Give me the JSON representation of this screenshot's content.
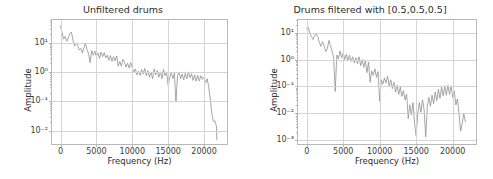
{
  "figure": {
    "background": "#ffffff",
    "line_color": "#8f8f8f",
    "grid_color": "#d4d4d4",
    "axis_color": "#b8b8b8"
  },
  "chart_data": [
    {
      "type": "line",
      "title": "Unfiltered drums",
      "xlabel": "Frequency (Hz)",
      "ylabel": "Amplitude",
      "yscale": "log",
      "xscale": "linear",
      "grid": true,
      "legend": "none",
      "xlim": [
        -1200,
        23200
      ],
      "ylim": [
        0.0035,
        60
      ],
      "xticks": [
        0,
        5000,
        10000,
        15000,
        20000
      ],
      "xticklabels": [
        "0",
        "5000",
        "10000",
        "15000",
        "20000"
      ],
      "yticks": [
        10,
        1,
        0.1,
        0.01
      ],
      "yticklabels": [
        "10¹",
        "10⁰",
        "10⁻¹",
        "10⁻²"
      ],
      "x": [
        0,
        220,
        440,
        660,
        880,
        1100,
        1320,
        1540,
        1760,
        1980,
        2200,
        2420,
        2640,
        2860,
        3080,
        3300,
        3520,
        3740,
        3960,
        4180,
        4400,
        4620,
        4840,
        5060,
        5280,
        5500,
        5720,
        5940,
        6160,
        6380,
        6600,
        6820,
        7040,
        7260,
        7480,
        7700,
        7920,
        8140,
        8360,
        8580,
        8800,
        9020,
        9240,
        9460,
        9680,
        9900,
        10120,
        10340,
        10560,
        10780,
        11000,
        11220,
        11440,
        11660,
        11880,
        12100,
        12320,
        12540,
        12760,
        12980,
        13200,
        13420,
        13640,
        13860,
        14080,
        14300,
        14520,
        14740,
        14960,
        15180,
        15400,
        15620,
        15840,
        16060,
        16280,
        16500,
        16720,
        16940,
        17160,
        17380,
        17600,
        17820,
        18040,
        18260,
        18480,
        18700,
        18920,
        19140,
        19360,
        19580,
        19800,
        20020,
        20240,
        20460,
        20680,
        20900,
        21120,
        21340,
        21560,
        21780,
        22000,
        22050
      ],
      "y": [
        38,
        22,
        13,
        16,
        11,
        14,
        20,
        23,
        12,
        7.5,
        9.5,
        8,
        5.5,
        6.2,
        4.3,
        6.5,
        9.5,
        5.5,
        4.0,
        2.0,
        5.2,
        3.6,
        5.0,
        3.2,
        4.3,
        2.8,
        4.6,
        3.2,
        4.4,
        2.9,
        3.6,
        2.4,
        3.5,
        2.2,
        3.2,
        2.3,
        3.4,
        1.5,
        2.2,
        1.5,
        2.6,
        2.0,
        1.4,
        1.9,
        1.3,
        2.0,
        1.3,
        0.95,
        1.2,
        0.75,
        1.0,
        0.72,
        1.15,
        0.8,
        1.25,
        0.7,
        1.05,
        0.62,
        0.95,
        0.55,
        1.2,
        0.75,
        1.05,
        0.62,
        0.95,
        0.55,
        1.15,
        0.7,
        0.95,
        0.32,
        0.62,
        0.9,
        0.55,
        0.85,
        0.085,
        0.7,
        0.95,
        0.55,
        0.8,
        0.5,
        0.85,
        0.55,
        0.95,
        0.6,
        0.82,
        0.48,
        0.75,
        0.45,
        0.72,
        0.46,
        0.7,
        0.52,
        0.62,
        0.4,
        0.55,
        0.28,
        0.11,
        0.035,
        0.018,
        0.019,
        0.012,
        0.0042
      ]
    },
    {
      "type": "line",
      "title": "Drums filtered with [0.5,0.5,0.5]",
      "xlabel": "Frequency (Hz)",
      "ylabel": "Amplitude",
      "yscale": "log",
      "xscale": "linear",
      "grid": true,
      "legend": "none",
      "xlim": [
        -1200,
        23200
      ],
      "ylim": [
        0.0007,
        30
      ],
      "xticks": [
        0,
        5000,
        10000,
        15000,
        20000
      ],
      "xticklabels": [
        "0",
        "5000",
        "10000",
        "15000",
        "20000"
      ],
      "yticks": [
        10,
        1,
        0.1,
        0.01,
        0.001
      ],
      "yticklabels": [
        "10¹",
        "10⁰",
        "10⁻¹",
        "10⁻²",
        "10⁻³"
      ],
      "x": [
        0,
        220,
        440,
        660,
        880,
        1100,
        1320,
        1540,
        1760,
        1980,
        2200,
        2420,
        2640,
        2860,
        3080,
        3300,
        3520,
        3740,
        3960,
        4180,
        4400,
        4620,
        4840,
        5060,
        5280,
        5500,
        5720,
        5940,
        6160,
        6380,
        6600,
        6820,
        7040,
        7260,
        7480,
        7700,
        7920,
        8140,
        8360,
        8580,
        8800,
        9020,
        9240,
        9460,
        9680,
        9900,
        10120,
        10340,
        10560,
        10780,
        11000,
        11220,
        11440,
        11660,
        11880,
        12100,
        12320,
        12540,
        12760,
        12980,
        13200,
        13420,
        13640,
        13860,
        14080,
        14300,
        14520,
        14740,
        14960,
        15180,
        15400,
        15620,
        15840,
        16060,
        16280,
        16500,
        16720,
        16940,
        17160,
        17380,
        17600,
        17820,
        18040,
        18260,
        18480,
        18700,
        18920,
        19140,
        19360,
        19580,
        19800,
        20020,
        20240,
        20460,
        20680,
        20900,
        21120,
        21340,
        21560,
        21780,
        22000,
        22050
      ],
      "y": [
        14,
        16,
        9.5,
        7.0,
        5.5,
        7.5,
        9.0,
        7.0,
        4.2,
        3.0,
        4.5,
        3.2,
        1.9,
        2.4,
        5.0,
        3.2,
        2.0,
        1.1,
        0.058,
        1.4,
        1.0,
        2.0,
        1.1,
        1.7,
        0.95,
        1.5,
        0.85,
        1.4,
        0.8,
        1.2,
        0.7,
        1.1,
        0.65,
        1.2,
        0.55,
        0.95,
        0.48,
        0.88,
        0.3,
        0.75,
        0.13,
        0.35,
        0.24,
        0.42,
        0.2,
        0.33,
        0.025,
        0.16,
        0.11,
        0.19,
        0.12,
        0.22,
        0.095,
        0.16,
        0.075,
        0.13,
        0.055,
        0.1,
        0.045,
        0.085,
        0.038,
        0.062,
        0.028,
        0.046,
        0.0055,
        0.018,
        0.0075,
        0.022,
        0.0035,
        0.0012,
        0.0085,
        0.022,
        0.0095,
        0.028,
        0.012,
        0.0011,
        0.015,
        0.035,
        0.016,
        0.042,
        0.02,
        0.055,
        0.026,
        0.07,
        0.032,
        0.085,
        0.04,
        0.095,
        0.042,
        0.1,
        0.045,
        0.095,
        0.035,
        0.06,
        0.018,
        0.03,
        0.0085,
        0.0018,
        0.0035,
        0.0085,
        0.0042
      ]
    }
  ]
}
